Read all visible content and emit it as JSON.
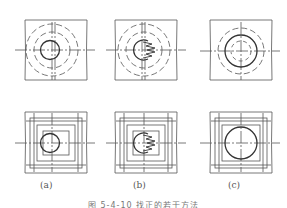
{
  "figure": {
    "panels": [
      {
        "id": "a",
        "label": "(a)",
        "top_view": "concentric dashed circles around small hole",
        "bottom_view": "nested rectangular grid around small hole"
      },
      {
        "id": "b",
        "label": "(b)",
        "top_view": "concentric dashed circles with serrated cutter in hole",
        "bottom_view": "nested rectangular grid with serrated cutter in hole"
      },
      {
        "id": "c",
        "label": "(c)",
        "top_view": "enlarged hole with one dashed circle",
        "bottom_view": "enlarged hole with rectangular grid"
      }
    ],
    "caption": "图 5-4-10  找正的若干方法"
  },
  "colors": {
    "line": "#555555",
    "thick": "#333333",
    "background": "#ffffff"
  }
}
